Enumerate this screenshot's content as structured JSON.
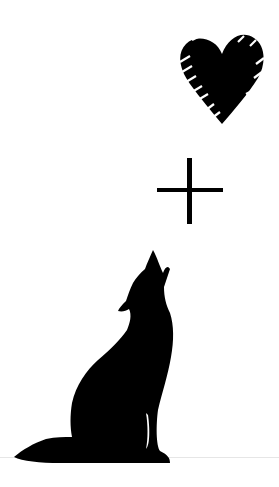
{
  "image": {
    "description": "Heart plus howling wolf silhouette",
    "elements": [
      {
        "icon": "heart-icon",
        "style": "scribbled black heart"
      },
      {
        "icon": "plus-icon",
        "style": "thin black plus sign"
      },
      {
        "icon": "wolf-icon",
        "style": "black howling wolf silhouette"
      }
    ]
  },
  "colors": {
    "background": "#ffffff",
    "ink": "#000000",
    "ground_line": "#e6e6e6"
  }
}
